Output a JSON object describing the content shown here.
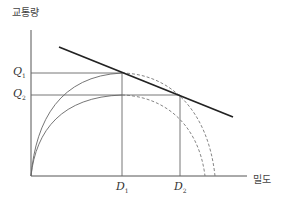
{
  "axes": {
    "y_label": "교통량",
    "x_label": "밀도"
  },
  "ticks": {
    "q1": {
      "main": "Q",
      "sub": "1"
    },
    "q2": {
      "main": "Q",
      "sub": "2"
    },
    "d1": {
      "main": "D",
      "sub": "1"
    },
    "d2": {
      "main": "D",
      "sub": "2"
    }
  },
  "colors": {
    "axis": "#555555",
    "curve": "#666666",
    "dashed": "#777777",
    "thick_line": "#222222"
  }
}
